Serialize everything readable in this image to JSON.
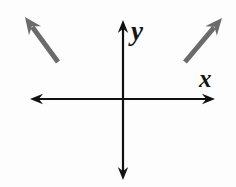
{
  "figure": {
    "width": 236,
    "height": 187,
    "background_color": "#fdfdfd"
  },
  "axes": {
    "color": "#111111",
    "stroke_width": 2.2,
    "origin": {
      "x": 123,
      "y": 99
    },
    "x_axis": {
      "label": "x",
      "label_position": {
        "x": 207,
        "y": 81
      },
      "start": {
        "x": 30,
        "y": 99
      },
      "end": {
        "x": 215,
        "y": 99
      },
      "arrowheads": "both"
    },
    "y_axis": {
      "label": "y",
      "label_position": {
        "x": 140,
        "y": 32
      },
      "start": {
        "x": 123,
        "y": 20
      },
      "end": {
        "x": 123,
        "y": 180
      },
      "arrowheads": "both"
    }
  },
  "vectors": [
    {
      "name": "upper-left-arrow",
      "quadrant": "II",
      "direction": "up-left",
      "color": "#6b6b6b",
      "stroke_width": 5,
      "tail": {
        "x": 58,
        "y": 62
      },
      "tip": {
        "x": 25,
        "y": 17
      }
    },
    {
      "name": "upper-right-arrow",
      "quadrant": "I",
      "direction": "up-right",
      "color": "#6b6b6b",
      "stroke_width": 5,
      "tail": {
        "x": 185,
        "y": 62
      },
      "tip": {
        "x": 222,
        "y": 18
      }
    }
  ],
  "chart_data": {
    "type": "scatter",
    "title": "",
    "xlabel": "x",
    "ylabel": "y",
    "grid": false,
    "legend": "none",
    "axis_style": "double-arrow cartesian",
    "series": [
      {
        "name": "upper-left-arrow",
        "kind": "vector",
        "tail": {
          "x": 58,
          "y": 62
        },
        "tip": {
          "x": 25,
          "y": 17
        }
      },
      {
        "name": "upper-right-arrow",
        "kind": "vector",
        "tail": {
          "x": 185,
          "y": 62
        },
        "tip": {
          "x": 222,
          "y": 18
        }
      }
    ]
  }
}
